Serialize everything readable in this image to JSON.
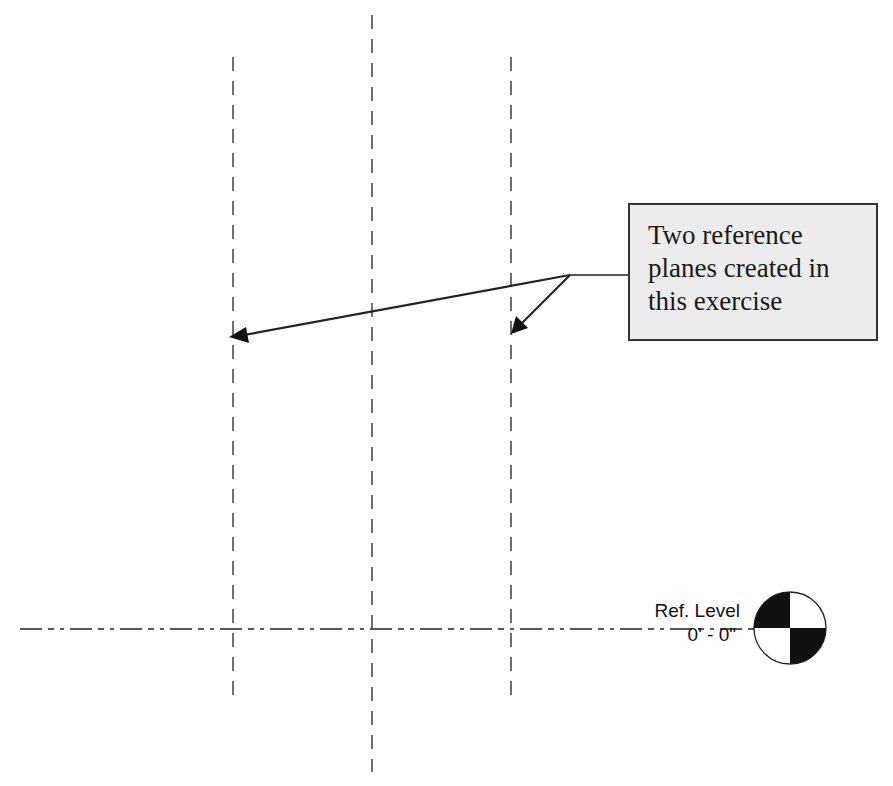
{
  "callout": {
    "lines": [
      "Two reference",
      "planes created in",
      "this exercise"
    ]
  },
  "level": {
    "name": "Ref. Level",
    "elevation": "0' - 0\""
  },
  "reference_planes": [
    {
      "name": "reference-plane-left",
      "x": 233
    },
    {
      "name": "reference-plane-center",
      "x": 372
    },
    {
      "name": "reference-plane-right",
      "x": 511
    }
  ]
}
